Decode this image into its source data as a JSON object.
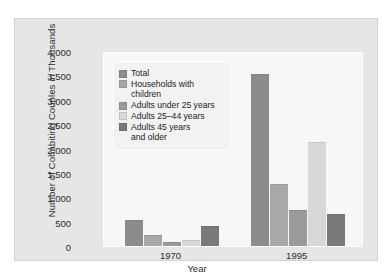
{
  "chart_data": {
    "type": "bar",
    "title": "",
    "xlabel": "Year",
    "ylabel": "Number of Cohabiting Couples in Thousands",
    "categories": [
      "1970",
      "1995"
    ],
    "ylim": [
      0,
      4000
    ],
    "yticks": [
      "0",
      "500",
      "1,000",
      "1,500",
      "2,000",
      "2,500",
      "3,000",
      "3,500",
      "4,000"
    ],
    "ytick_values": [
      0,
      500,
      1000,
      1500,
      2000,
      2500,
      3000,
      3500,
      4000
    ],
    "grid": false,
    "legend_position": "upper left inside plot",
    "series": [
      {
        "name": "Total",
        "color": "#8c8c8c",
        "values": [
          520,
          3500
        ]
      },
      {
        "name": "Households with\nchildren",
        "color": "#a8a8a8",
        "values": [
          200,
          1250
        ]
      },
      {
        "name": "Adults under 25 years",
        "color": "#9a9a9a",
        "values": [
          55,
          720
        ]
      },
      {
        "name": "Adults 25–44 years",
        "color": "#d8d8d8",
        "values": [
          105,
          2120
        ]
      },
      {
        "name": "Adults 45 years\nand older",
        "color": "#7a7a7a",
        "values": [
          380,
          640
        ]
      }
    ]
  },
  "colors": {
    "figure_background": "#e6e6e6",
    "plot_background": "#f7f7f7",
    "legend_background": "#f2f2f2",
    "text": "#2b2b2b"
  }
}
